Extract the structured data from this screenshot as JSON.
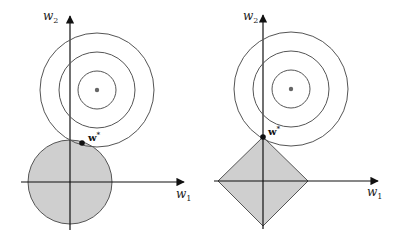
{
  "panels": [
    {
      "id": "l2",
      "constraint_shape": "circle",
      "axis_x_label": "w",
      "axis_x_sub": "1",
      "axis_y_label": "w",
      "axis_y_sub": "2",
      "optimum_label": "w",
      "optimum_sup": "*"
    },
    {
      "id": "l1",
      "constraint_shape": "diamond",
      "axis_x_label": "w",
      "axis_x_sub": "1",
      "axis_y_label": "w",
      "axis_y_sub": "2",
      "optimum_label": "w",
      "optimum_sup": "*"
    }
  ],
  "colors": {
    "region_fill": "#cfcfcf",
    "contour": "#555555",
    "axis": "#111111",
    "center_dot": "#666666"
  }
}
